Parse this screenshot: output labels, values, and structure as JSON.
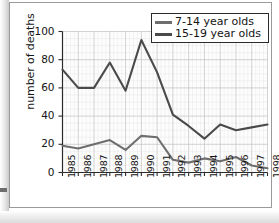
{
  "chart_data": {
    "type": "line",
    "title": "",
    "xlabel": "",
    "ylabel": "number of deaths",
    "ylim": [
      0,
      100
    ],
    "yticks": [
      0,
      20,
      40,
      60,
      80,
      100
    ],
    "grid": true,
    "legend_position": "top-right",
    "categories": [
      "1985",
      "1986",
      "1987",
      "1988",
      "1989",
      "1990",
      "1991",
      "1992",
      "1993",
      "1994",
      "1995",
      "1996",
      "1997",
      "1998"
    ],
    "series": [
      {
        "name": "7-14 year olds",
        "color": "#6e6e6e",
        "values": [
          19,
          17,
          20,
          23,
          16,
          26,
          25,
          9,
          7,
          10,
          8,
          11,
          5,
          3
        ]
      },
      {
        "name": "15-19 year olds",
        "color": "#4a4a4a",
        "values": [
          73,
          60,
          60,
          78,
          58,
          94,
          71,
          41,
          33,
          24,
          34,
          30,
          32,
          34
        ]
      }
    ]
  },
  "legend": {
    "items": [
      {
        "label": "7-14 year olds"
      },
      {
        "label": "15-19 year olds"
      }
    ]
  },
  "axes": {
    "y_title": "number of deaths",
    "y_tick_labels": [
      "100",
      "80",
      "60",
      "40",
      "20",
      "0"
    ],
    "x_tick_labels": [
      "1985",
      "1986",
      "1987",
      "1988",
      "1989",
      "1990",
      "1991",
      "1992",
      "1993",
      "1994",
      "1995",
      "1996",
      "1997",
      "1998"
    ]
  }
}
